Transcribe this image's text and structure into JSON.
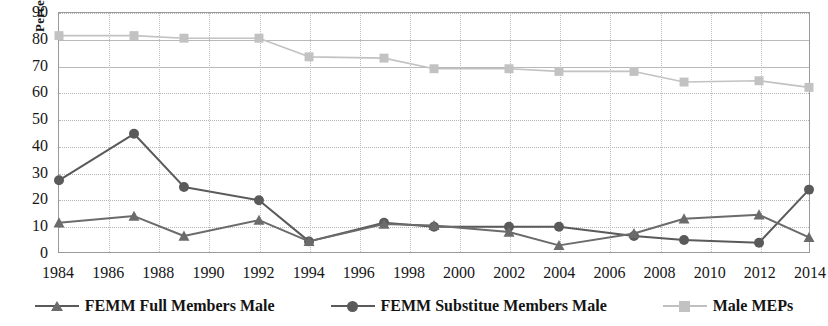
{
  "chart_data": {
    "type": "line",
    "title": "",
    "xlabel": "",
    "ylabel": "Percent",
    "ylim": [
      0,
      90
    ],
    "ytick_step": 10,
    "yticks": [
      "90",
      "80",
      "70",
      "60",
      "50",
      "40",
      "30",
      "20",
      "10",
      "0"
    ],
    "xticks": [
      "1984",
      "1986",
      "1988",
      "1990",
      "1992",
      "1994",
      "1996",
      "1998",
      "2000",
      "2002",
      "2004",
      "2006",
      "2008",
      "2010",
      "2012",
      "2014"
    ],
    "xlim": [
      1984,
      2014
    ],
    "grid": "both",
    "legend_position": "bottom",
    "x": [
      1984,
      1987,
      1989,
      1992,
      1994,
      1997,
      1999,
      2002,
      2004,
      2007,
      2009,
      2012,
      2014
    ],
    "series": [
      {
        "name": "FEMM Full Members Male",
        "marker": "triangle",
        "color": "#6b6b6b",
        "values": [
          11,
          13.5,
          6,
          12,
          4,
          10.5,
          10,
          7.5,
          2.5,
          7,
          12.5,
          14,
          5.5
        ]
      },
      {
        "name": "FEMM Substitue Members Male",
        "marker": "circle",
        "color": "#5a5a5a",
        "values": [
          27,
          44.5,
          24.5,
          19.5,
          4,
          11,
          9.5,
          9.5,
          9.5,
          6,
          4.5,
          3.5,
          23.5
        ]
      },
      {
        "name": "Male MEPs",
        "marker": "square",
        "color": "#c2c2c2",
        "values": [
          81.5,
          81.5,
          80.5,
          80.5,
          73.5,
          73,
          69,
          69,
          68,
          68,
          64,
          64.5,
          62
        ]
      }
    ]
  },
  "legend": {
    "items": [
      {
        "label": "FEMM Full Members Male",
        "marker": "triangle-marker-icon",
        "color": "#6b6b6b"
      },
      {
        "label": "FEMM Substitue Members Male",
        "marker": "circle-marker-icon",
        "color": "#5a5a5a"
      },
      {
        "label": "Male MEPs",
        "marker": "square-marker-icon",
        "color": "#c2c2c2"
      }
    ]
  },
  "axes": {
    "y_axis_title": "Percent"
  }
}
